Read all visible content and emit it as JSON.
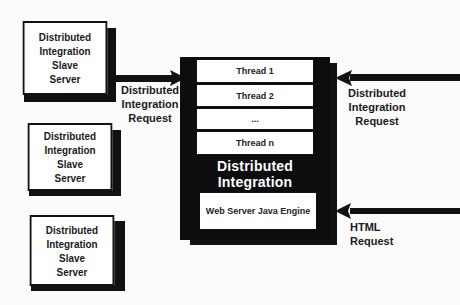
{
  "slave_servers": [
    {
      "lines": [
        "Distributed",
        "Integration",
        "Slave",
        "Server"
      ]
    },
    {
      "lines": [
        "Distributed",
        "Integration",
        "Slave",
        "Server"
      ]
    },
    {
      "lines": [
        "Distributed",
        "Integration",
        "Slave",
        "Server"
      ]
    }
  ],
  "server": {
    "threads": [
      "Thread 1",
      "Thread 2",
      "...",
      "Thread n"
    ],
    "title_line1": "Distributed Integration",
    "title_line2": "SERVER",
    "engine": "Web Server Java Engine"
  },
  "labels": {
    "left_request": [
      "Distributed",
      "Integration",
      "Request"
    ],
    "right_request": [
      "Distributed",
      "Integration",
      "Request"
    ],
    "html_request": [
      "HTML",
      "Request"
    ]
  },
  "colors": {
    "ink": "#111111",
    "paper": "#ffffff",
    "background": "#fbfbfb"
  }
}
